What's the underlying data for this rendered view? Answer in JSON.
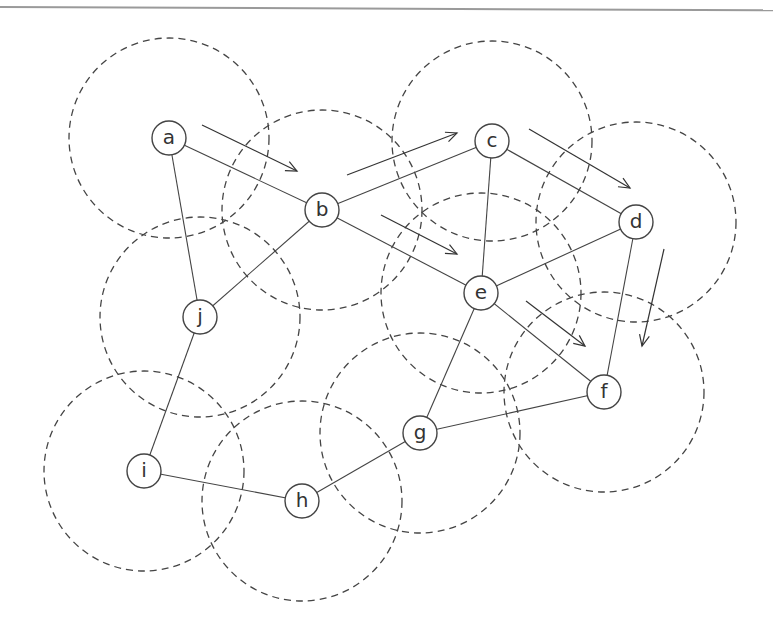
{
  "diagram": {
    "type": "network-graph",
    "node_radius": 17,
    "range_radius": 100,
    "colors": {
      "stroke": "#444444",
      "background": "#ffffff",
      "top_rule": "#9a9a9a"
    },
    "nodes": [
      {
        "id": "a",
        "label": "a",
        "x": 169,
        "y": 138
      },
      {
        "id": "b",
        "label": "b",
        "x": 322,
        "y": 210
      },
      {
        "id": "c",
        "label": "c",
        "x": 492,
        "y": 141
      },
      {
        "id": "d",
        "label": "d",
        "x": 636,
        "y": 222
      },
      {
        "id": "e",
        "label": "e",
        "x": 481,
        "y": 293
      },
      {
        "id": "f",
        "label": "f",
        "x": 604,
        "y": 392
      },
      {
        "id": "g",
        "label": "g",
        "x": 420,
        "y": 433
      },
      {
        "id": "h",
        "label": "h",
        "x": 302,
        "y": 501
      },
      {
        "id": "i",
        "label": "i",
        "x": 144,
        "y": 471
      },
      {
        "id": "j",
        "label": "j",
        "x": 200,
        "y": 317
      }
    ],
    "edges": [
      [
        "a",
        "b"
      ],
      [
        "a",
        "j"
      ],
      [
        "b",
        "c"
      ],
      [
        "b",
        "e"
      ],
      [
        "b",
        "j"
      ],
      [
        "c",
        "d"
      ],
      [
        "c",
        "e"
      ],
      [
        "d",
        "e"
      ],
      [
        "d",
        "f"
      ],
      [
        "e",
        "f"
      ],
      [
        "e",
        "g"
      ],
      [
        "f",
        "g"
      ],
      [
        "g",
        "h"
      ],
      [
        "h",
        "i"
      ],
      [
        "i",
        "j"
      ]
    ],
    "route_arrows": [
      {
        "from": "a",
        "to": "b",
        "x1": 202,
        "y1": 125,
        "x2": 297,
        "y2": 171
      },
      {
        "from": "b",
        "to": "c",
        "x1": 347,
        "y1": 175,
        "x2": 457,
        "y2": 133
      },
      {
        "from": "b",
        "to": "e",
        "x1": 381,
        "y1": 215,
        "x2": 457,
        "y2": 254
      },
      {
        "from": "c",
        "to": "d",
        "x1": 529,
        "y1": 129,
        "x2": 630,
        "y2": 188
      },
      {
        "from": "e",
        "to": "f",
        "x1": 526,
        "y1": 301,
        "x2": 585,
        "y2": 346
      },
      {
        "from": "d",
        "to": "f",
        "x1": 664,
        "y1": 249,
        "x2": 642,
        "y2": 346
      }
    ]
  }
}
